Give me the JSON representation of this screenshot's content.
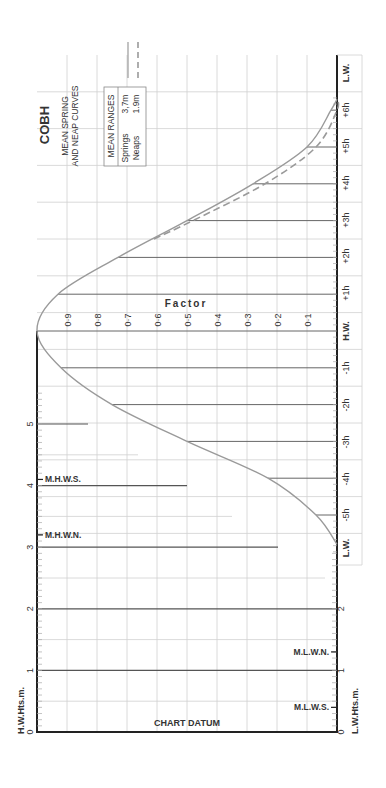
{
  "title": "COBH",
  "subtitle_lines": [
    "MEAN SPRING",
    "AND NEAP CURVES"
  ],
  "legend": {
    "header": "MEAN RANGES",
    "rows": [
      {
        "name": "Springs",
        "value": "3,7m",
        "style": "solid"
      },
      {
        "name": "Neaps",
        "value": "1.9m",
        "style": "dashed"
      }
    ]
  },
  "colors": {
    "curve": "#9a9a9a",
    "axis": "#222222",
    "grid": "#d0d0d0",
    "heavy_line": "#555555",
    "text": "#333333"
  },
  "labels": {
    "factor": "Factor",
    "hw_height_axis": "H.W.Hts.m.",
    "lw_height_axis": "L.W.Hts.m.",
    "chart_datum": "CHART DATUM",
    "mhws": "M.H.W.S.",
    "mhwn": "M.H.W.N.",
    "mlwn": "M.L.W.N.",
    "mlws": "M.L.W.S."
  },
  "chart_data": {
    "type": "line",
    "orientation": "rotated 90deg (time runs vertically, factor horizontally)",
    "xlabel": "Time relative to H.W.",
    "ylabel": "Factor",
    "time_ticks": [
      "L.W.",
      "-5h",
      "-4h",
      "-3h",
      "-2h",
      "-1h",
      "H.W.",
      "+1h",
      "+2h",
      "+3h",
      "+4h",
      "+5h",
      "+6h",
      "L.W."
    ],
    "factor_ticks": [
      "0·1",
      "0·2",
      "0·3",
      "0·4",
      "0·5",
      "0·6",
      "0·7",
      "0·8",
      "0·9"
    ],
    "hw_height_ticks": [
      "0",
      "1",
      "2",
      "3",
      "4",
      "5"
    ],
    "lw_height_ticks": [
      "0",
      "1",
      "2"
    ],
    "ylim": [
      0,
      1
    ],
    "height_range_m": [
      0,
      5
    ],
    "markers": {
      "MHWS": 4.1,
      "MHWN": 3.2,
      "MLWN": 1.3,
      "MLWS": 0.4
    },
    "series": [
      {
        "name": "Springs",
        "style": "solid",
        "x": [
          -5.8,
          -5,
          -4,
          -3,
          -2,
          -1,
          0,
          1,
          2,
          3,
          4,
          5,
          6,
          6.3
        ],
        "values": [
          0.0,
          0.07,
          0.23,
          0.5,
          0.75,
          0.92,
          1.0,
          0.93,
          0.73,
          0.5,
          0.28,
          0.1,
          0.02,
          0.0
        ]
      },
      {
        "name": "Neaps",
        "style": "dashed",
        "x": [
          2.5,
          3,
          4,
          5,
          6,
          6.3
        ],
        "values": [
          0.61,
          0.48,
          0.24,
          0.07,
          0.0,
          0.0
        ]
      }
    ],
    "grid": true
  }
}
